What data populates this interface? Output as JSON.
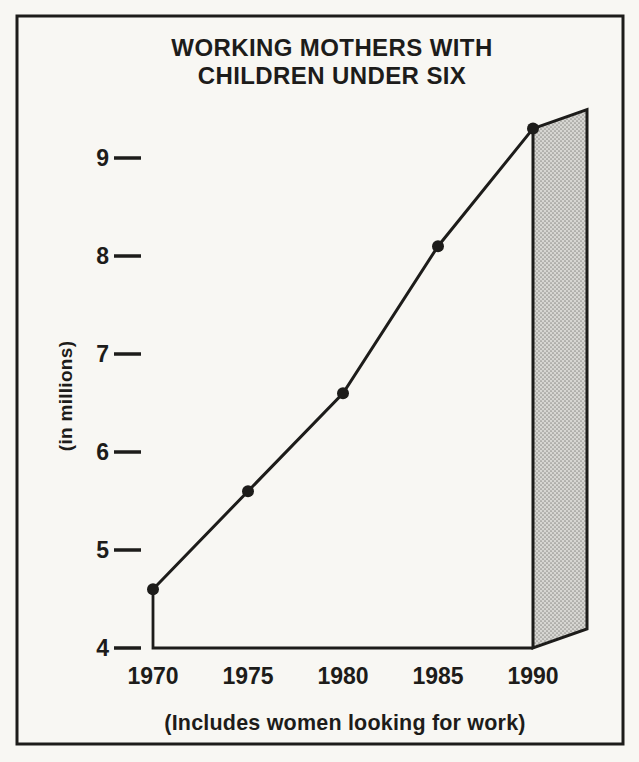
{
  "figure": {
    "title_line1": "WORKING MOTHERS WITH",
    "title_line2": "CHILDREN UNDER SIX",
    "y_axis_unit": "(in millions)",
    "footnote": "(Includes women looking for work)"
  },
  "colors": {
    "ink": "#1d1c1a",
    "paper": "#f8f7f3",
    "halftone_base": "#d7d6d2",
    "halftone_dot": "#92918c"
  },
  "chart_data": {
    "type": "line",
    "title": "WORKING MOTHERS WITH CHILDREN UNDER SIX",
    "x": [
      1970,
      1975,
      1980,
      1985,
      1990
    ],
    "x_tick_labels": [
      "1970",
      "1975",
      "1980",
      "1985",
      "1990"
    ],
    "series": [
      {
        "name": "Working mothers with children under six",
        "values": [
          4.6,
          5.6,
          6.6,
          8.1,
          9.3
        ]
      }
    ],
    "ylabel": "(in millions)",
    "xlabel": "",
    "y_ticks": [
      9,
      8,
      7,
      6,
      5,
      4
    ],
    "ylim": [
      4,
      9.5
    ],
    "grid": false,
    "legend": "none",
    "marker": "filled-circle",
    "annotation": "(Includes women looking for work)",
    "decoration": "3D halftone-shaded depth panel behind the 1990 endpoint column"
  }
}
